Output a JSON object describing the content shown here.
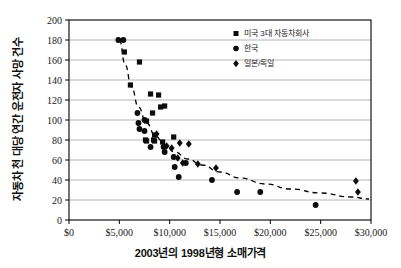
{
  "chart_data": {
    "type": "scatter",
    "title": "",
    "xlabel": "2003년의 1998년형 소매가격",
    "ylabel": "자동차 천 대당 연간 운전자 사망 건수",
    "xlim": [
      0,
      30000
    ],
    "ylim": [
      0,
      200
    ],
    "grid": "horizontal",
    "legend_position": "top-right",
    "xticks": [
      0,
      5000,
      10000,
      15000,
      20000,
      25000,
      30000
    ],
    "xtick_labels": [
      "$0",
      "$5,000",
      "$10,000",
      "$15,000",
      "$20,000",
      "$25,000",
      "$30,000"
    ],
    "yticks": [
      0,
      20,
      40,
      60,
      80,
      100,
      120,
      140,
      160,
      180,
      200
    ],
    "ytick_labels": [
      "0",
      "20",
      "40",
      "60",
      "80",
      "100",
      "120",
      "140",
      "160",
      "180",
      "200"
    ],
    "series": [
      {
        "name": "미국 3대 자동차회사",
        "marker": "square",
        "color": "#0d0d0d",
        "points": [
          [
            5500,
            168
          ],
          [
            6100,
            135
          ],
          [
            7000,
            158
          ],
          [
            8100,
            126
          ],
          [
            8900,
            125
          ],
          [
            8300,
            107
          ],
          [
            9100,
            113
          ],
          [
            9500,
            114
          ],
          [
            7700,
            99
          ],
          [
            7600,
            80
          ],
          [
            7700,
            79
          ],
          [
            8500,
            85
          ],
          [
            8500,
            79
          ],
          [
            9300,
            78
          ],
          [
            10400,
            83
          ],
          [
            8400,
            80
          ]
        ]
      },
      {
        "name": "한국",
        "marker": "circle",
        "color": "#0d0d0d",
        "points": [
          [
            4900,
            180
          ],
          [
            5400,
            180
          ],
          [
            6800,
            107
          ],
          [
            6900,
            97
          ],
          [
            7000,
            91
          ],
          [
            7500,
            100
          ],
          [
            7500,
            89
          ],
          [
            8100,
            73
          ],
          [
            9400,
            73
          ],
          [
            9500,
            68
          ],
          [
            10400,
            63
          ],
          [
            10500,
            53
          ],
          [
            10900,
            43
          ],
          [
            11600,
            57
          ],
          [
            14200,
            40
          ],
          [
            16700,
            28
          ],
          [
            19000,
            28
          ],
          [
            24500,
            15
          ]
        ]
      },
      {
        "name": "일본/독일",
        "marker": "diamond",
        "color": "#0d0d0d",
        "points": [
          [
            8700,
            86
          ],
          [
            9700,
            74
          ],
          [
            10200,
            72
          ],
          [
            10800,
            62
          ],
          [
            11000,
            77
          ],
          [
            11300,
            57
          ],
          [
            11900,
            76
          ],
          [
            12800,
            56
          ],
          [
            14600,
            52
          ],
          [
            28500,
            39
          ],
          [
            28700,
            28
          ]
        ]
      }
    ],
    "trendline": {
      "style": "dashed",
      "description": "감소하는 지수 추세선",
      "points": [
        [
          5000,
          180
        ],
        [
          5600,
          155
        ],
        [
          6200,
          133
        ],
        [
          6900,
          113
        ],
        [
          7700,
          97
        ],
        [
          8600,
          84
        ],
        [
          9500,
          75
        ],
        [
          10500,
          68
        ],
        [
          11800,
          61
        ],
        [
          13200,
          55
        ],
        [
          15000,
          48
        ],
        [
          17000,
          42
        ],
        [
          19500,
          36
        ],
        [
          22000,
          31
        ],
        [
          25000,
          27
        ],
        [
          28000,
          23
        ],
        [
          29800,
          21
        ]
      ]
    },
    "legend": [
      {
        "label": "미국 3대 자동차회사",
        "marker": "square"
      },
      {
        "label": "한국",
        "marker": "circle"
      },
      {
        "label": "일본/독일",
        "marker": "diamond"
      }
    ]
  }
}
